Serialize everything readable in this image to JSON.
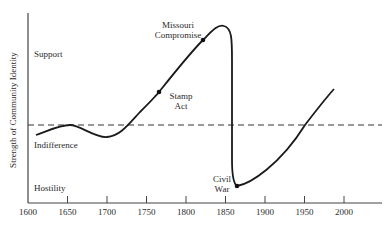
{
  "chart_data": {
    "type": "line",
    "title": "",
    "xlabel": "",
    "ylabel": "Strength of Community Identity",
    "xlim": [
      1600,
      2050
    ],
    "ylim": [
      0,
      100
    ],
    "x_ticks": [
      1600,
      1650,
      1700,
      1750,
      1800,
      1850,
      1900,
      1950,
      2000
    ],
    "y_level_labels": [
      {
        "label": "Support",
        "value": 83
      },
      {
        "label": "Indifference",
        "value": 33
      },
      {
        "label": "Hostility",
        "value": 5
      }
    ],
    "reference_line": {
      "label": "Indifference baseline",
      "value": 41,
      "style": "dashed"
    },
    "grid": false,
    "legend": null,
    "series": [
      {
        "name": "Strength of Community Identity",
        "x": [
          1610,
          1635,
          1660,
          1685,
          1705,
          1730,
          1765,
          1795,
          1820,
          1840,
          1848,
          1851,
          1853,
          1856,
          1862,
          1900,
          1950,
          1990
        ],
        "values": [
          36,
          39,
          41,
          37,
          35,
          40,
          58,
          74,
          86,
          93,
          91,
          70,
          25,
          11,
          9,
          20,
          41,
          60
        ]
      }
    ],
    "annotations": [
      {
        "label": "Stamp Act",
        "x": 1765,
        "value": 58
      },
      {
        "label": "Missouri Compromise",
        "x": 1820,
        "value": 86
      },
      {
        "label": "Civil War",
        "x": 1862,
        "value": 9
      }
    ]
  },
  "axis": {
    "y_title": "Strength of Community Identity",
    "x_ticks": [
      "1600",
      "1650",
      "1700",
      "1750",
      "1800",
      "1850",
      "1900",
      "1950",
      "2000"
    ],
    "levels": {
      "support": "Support",
      "indifference": "Indifference",
      "hostility": "Hostility"
    }
  },
  "annotations": {
    "missouri_line1": "Missouri",
    "missouri_line2": "Compromise",
    "stamp_line1": "Stamp",
    "stamp_line2": "Act",
    "civil_line1": "Civil",
    "civil_line2": "War"
  },
  "colors": {
    "line": "#1a1a1a",
    "axis": "#444444",
    "dash": "#333333"
  }
}
